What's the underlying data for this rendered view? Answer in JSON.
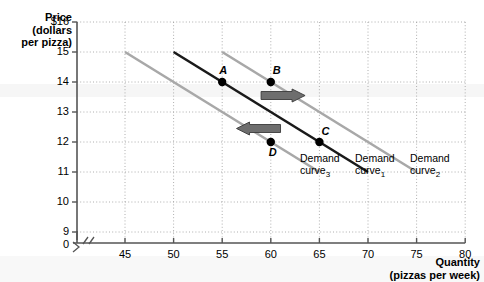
{
  "chart_data": {
    "type": "line",
    "title": "",
    "xlabel": "Quantity (pizzas per week)",
    "ylabel": "Price (dollars per pizza)",
    "xlim": [
      40,
      80
    ],
    "ylim": [
      8.5,
      16
    ],
    "grid": true,
    "legend_position": "inline-right",
    "x_ticks": [
      "0",
      "45",
      "50",
      "55",
      "60",
      "65",
      "70",
      "75",
      "80"
    ],
    "y_ticks": [
      "$16",
      "15",
      "14",
      "13",
      "12",
      "11",
      "10",
      "9",
      "0"
    ],
    "axis_break_x": true,
    "axis_break_y": true,
    "series": [
      {
        "name": "Demand curve3",
        "label_line1": "Demand",
        "label_line2": "curve",
        "label_sub": "3",
        "color": "#a8a8a8",
        "x": [
          45,
          65
        ],
        "y": [
          15,
          11
        ]
      },
      {
        "name": "Demand curve1",
        "label_line1": "Demand",
        "label_line2": "curve",
        "label_sub": "1",
        "color": "#1a1a1a",
        "x": [
          50,
          70
        ],
        "y": [
          15,
          11
        ]
      },
      {
        "name": "Demand curve2",
        "label_line1": "Demand",
        "label_line2": "curve",
        "label_sub": "2",
        "color": "#a8a8a8",
        "x": [
          55,
          75
        ],
        "y": [
          15,
          11
        ]
      }
    ],
    "points": [
      {
        "label": "A",
        "x": 55,
        "y": 14,
        "on_series": "Demand curve1"
      },
      {
        "label": "B",
        "x": 60,
        "y": 14,
        "on_series": "Demand curve2"
      },
      {
        "label": "C",
        "x": 65,
        "y": 12,
        "on_series": "Demand curve1"
      },
      {
        "label": "D",
        "x": 60,
        "y": 12,
        "on_series": "Demand curve3"
      }
    ],
    "annotations": [
      {
        "name": "increase-shift-arrow",
        "direction": "right",
        "x_from": 59,
        "y_at": 13.55
      },
      {
        "name": "decrease-shift-arrow",
        "direction": "left",
        "x_from": 61,
        "y_at": 12.45
      }
    ]
  },
  "labels": {
    "price_title_line1": "Price",
    "price_title_line2": "(dollars",
    "price_title_line3": "per pizza)",
    "quantity_title_line1": "Quantity",
    "quantity_title_line2": "(pizzas per week)"
  }
}
